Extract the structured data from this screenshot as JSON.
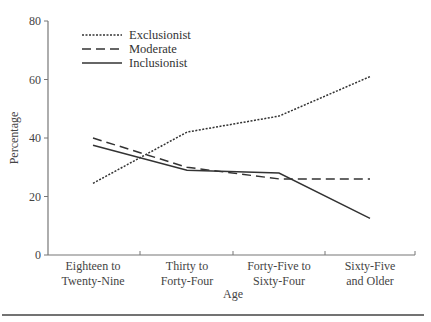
{
  "chart_data": {
    "type": "line",
    "title": "",
    "xlabel": "Age",
    "ylabel": "Percentage",
    "ylim": [
      0,
      80
    ],
    "yticks": [
      0,
      20,
      40,
      60,
      80
    ],
    "grid": false,
    "legend_position": "upper-left",
    "categories": [
      [
        "Eighteen to",
        "Twenty-Nine"
      ],
      [
        "Thirty to",
        "Forty-Four"
      ],
      [
        "Forty-Five to",
        "Sixty-Four"
      ],
      [
        "Sixty-Five",
        "and Older"
      ]
    ],
    "series": [
      {
        "name": "Exclusionist",
        "style": "dotted",
        "values": [
          24.5,
          42,
          47.5,
          61
        ]
      },
      {
        "name": "Moderate",
        "style": "dashed",
        "values": [
          40,
          30,
          26,
          26
        ]
      },
      {
        "name": "Inclusionist",
        "style": "solid",
        "values": [
          37.5,
          29,
          28,
          12.5
        ]
      }
    ]
  },
  "colors": {
    "line": "#333333",
    "axis": "#777777"
  }
}
